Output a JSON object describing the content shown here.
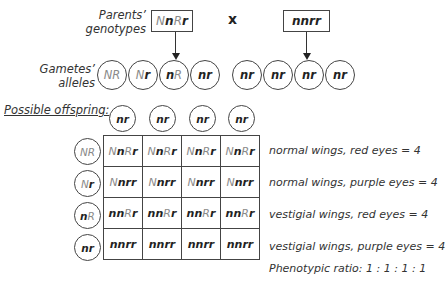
{
  "labels": {
    "parents_line1": "Parents’",
    "parents_line2": "genotypes",
    "gametes_line1": "Gametes’",
    "gametes_line2": "alleles",
    "cross_symbol": "x",
    "offspring_title": "Possible offspring:",
    "ratio": "Phenotypic ratio:  1 : 1 : 1 : 1"
  },
  "parents": [
    {
      "genotype": "NnRr",
      "parts": [
        {
          "t": "N",
          "case": "up"
        },
        {
          "t": "n",
          "case": "lo"
        },
        {
          "t": "R",
          "case": "up"
        },
        {
          "t": "r",
          "case": "lo"
        }
      ]
    },
    {
      "genotype": "nnrr",
      "parts": [
        {
          "t": "nnrr",
          "case": "lo"
        }
      ]
    }
  ],
  "gametes_left": [
    {
      "parts": [
        {
          "t": "NR",
          "case": "up"
        }
      ]
    },
    {
      "parts": [
        {
          "t": "N",
          "case": "up"
        },
        {
          "t": "r",
          "case": "lo"
        }
      ]
    },
    {
      "parts": [
        {
          "t": "n",
          "case": "lo"
        },
        {
          "t": "R",
          "case": "up"
        }
      ]
    },
    {
      "parts": [
        {
          "t": "nr",
          "case": "lo"
        }
      ]
    }
  ],
  "gametes_right": [
    "nr",
    "nr",
    "nr",
    "nr"
  ],
  "punnett": {
    "col_headers": [
      "nr",
      "nr",
      "nr",
      "nr"
    ],
    "row_headers": [
      {
        "parts": [
          {
            "t": "NR",
            "case": "up"
          }
        ]
      },
      {
        "parts": [
          {
            "t": "N",
            "case": "up"
          },
          {
            "t": "r",
            "case": "lo"
          }
        ]
      },
      {
        "parts": [
          {
            "t": "n",
            "case": "lo"
          },
          {
            "t": "R",
            "case": "up"
          }
        ]
      },
      {
        "parts": [
          {
            "t": "nr",
            "case": "lo"
          }
        ]
      }
    ],
    "rows": [
      {
        "cells": [
          "NnRr",
          "NnRr",
          "NnRr",
          "NnRr"
        ],
        "parts": [
          {
            "t": "N",
            "case": "up"
          },
          {
            "t": "n",
            "case": "lo"
          },
          {
            "t": "R",
            "case": "up"
          },
          {
            "t": "r",
            "case": "lo"
          }
        ],
        "phenotype": "normal wings, red eyes = 4"
      },
      {
        "cells": [
          "Nnrr",
          "Nnrr",
          "Nnrr",
          "Nnrr"
        ],
        "parts": [
          {
            "t": "N",
            "case": "up"
          },
          {
            "t": "nrr",
            "case": "lo"
          }
        ],
        "phenotype": "normal wings, purple eyes = 4"
      },
      {
        "cells": [
          "nnRr",
          "nnRr",
          "nnRr",
          "nnRr"
        ],
        "parts": [
          {
            "t": "nn",
            "case": "lo"
          },
          {
            "t": "R",
            "case": "up"
          },
          {
            "t": "r",
            "case": "lo"
          }
        ],
        "phenotype": "vestigial wings, red eyes = 4"
      },
      {
        "cells": [
          "nnrr",
          "nnrr",
          "nnrr",
          "nnrr"
        ],
        "parts": [
          {
            "t": "nnrr",
            "case": "lo"
          }
        ],
        "phenotype": "vestigial wings, purple eyes = 4"
      }
    ]
  },
  "colors": {
    "dominant_allele": "#8a8a8a",
    "recessive_allele": "#222222",
    "lines": "#444444"
  }
}
